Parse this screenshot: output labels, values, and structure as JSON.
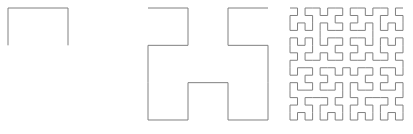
{
  "figure": {
    "background_color": "#ffffff",
    "stroke_color": "#808080",
    "stroke_width": 1,
    "width": 413,
    "height": 134
  },
  "chart_data": {
    "type": "line",
    "subtitle": "Three successive approximations of the Hilbert space-filling curve",
    "xlabel": "",
    "ylabel": "",
    "grid": false,
    "legend": "none",
    "panel_count": 3,
    "panels": [
      {
        "name": "hilbert-order-1",
        "label": "Order 1",
        "order": 1,
        "grid_size": 2,
        "segment_count": 3,
        "vertex_count": 4,
        "x_origin": 8,
        "y_origin": 8,
        "x_extent": 120,
        "y_extent": 112,
        "cell_x": 60,
        "cell_y": 37.33,
        "x": [
          8,
          8,
          68,
          68,
          128,
          128
        ],
        "y": [
          120,
          8,
          8,
          120,
          120,
          8
        ],
        "vertices_grid": [
          [
            0,
            1
          ],
          [
            0,
            0
          ],
          [
            1,
            0
          ],
          [
            1,
            1
          ]
        ]
      },
      {
        "name": "hilbert-order-2",
        "label": "Order 2",
        "order": 2,
        "grid_size": 4,
        "segment_count": 15,
        "vertex_count": 16,
        "x_origin": 148,
        "y_origin": 8,
        "x_extent": 120,
        "y_extent": 112,
        "cell_x": 40,
        "cell_y": 37.33,
        "vertices_grid": [
          [
            0,
            0
          ],
          [
            1,
            0
          ],
          [
            1,
            1
          ],
          [
            0,
            1
          ],
          [
            0,
            2
          ],
          [
            0,
            3
          ],
          [
            1,
            3
          ],
          [
            1,
            2
          ],
          [
            2,
            2
          ],
          [
            2,
            3
          ],
          [
            3,
            3
          ],
          [
            3,
            2
          ],
          [
            3,
            1
          ],
          [
            2,
            1
          ],
          [
            2,
            0
          ],
          [
            3,
            0
          ]
        ]
      },
      {
        "name": "hilbert-order-4",
        "label": "Order 4",
        "order": 4,
        "grid_size": 16,
        "segment_count": 255,
        "vertex_count": 256,
        "x_origin": 290,
        "y_origin": 8,
        "x_extent": 113,
        "y_extent": 112,
        "cell_x": 7.533,
        "cell_y": 7.467
      }
    ]
  }
}
